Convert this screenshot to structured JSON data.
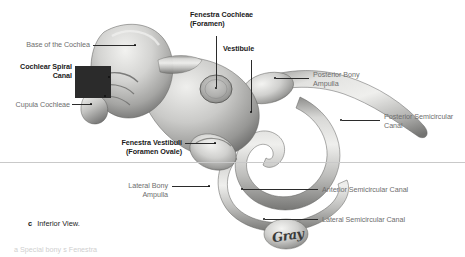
{
  "figure": {
    "caption_letter": "c",
    "caption_text": "Inferior View.",
    "signature": "Gray",
    "cropped_bottom_text": "a  Special  bony  s   Fenestra"
  },
  "labels": [
    {
      "id": "base-of-the-cochlea",
      "text": "Base of the Cochlea",
      "style": "regular",
      "align": "right"
    },
    {
      "id": "cochlear-spiral-canal",
      "text": "Cochlear Spiral\nCanal",
      "style": "bold",
      "align": "right"
    },
    {
      "id": "cupula-cochleae",
      "text": "Cupula Cochleae",
      "style": "regular",
      "align": "right"
    },
    {
      "id": "fenestra-cochleae",
      "text": "Fenestra Cochleae\n(Foramen)",
      "style": "bold",
      "align": "left"
    },
    {
      "id": "vestibule",
      "text": "Vestibule",
      "style": "bold",
      "align": "left"
    },
    {
      "id": "posterior-bony-ampulla",
      "text": "Posterior Bony\nAmpulla",
      "style": "regular",
      "align": "left"
    },
    {
      "id": "posterior-semicircular-canal",
      "text": "Posterior Semicircular\nCanal",
      "style": "regular",
      "align": "left"
    },
    {
      "id": "fenestra-vestibuli",
      "text": "Fenestra Vestibuli\n(Foramen Ovale)",
      "style": "bold",
      "align": "right"
    },
    {
      "id": "lateral-bony-ampulla",
      "text": "Lateral Bony\nAmpulla",
      "style": "regular",
      "align": "right"
    },
    {
      "id": "anterior-semicircular-canal",
      "text": "Anterior Semicircular Canal",
      "style": "regular",
      "align": "left"
    },
    {
      "id": "lateral-semicircular-canal",
      "text": "Lateral Semicircular Canal",
      "style": "regular",
      "align": "left"
    }
  ],
  "colors": {
    "background": "#ffffff",
    "label_gray": "#6e6e6e",
    "label_bold": "#1a1a1a",
    "leader_line": "#2b2b2b",
    "rule": "#c9c9c9",
    "specimen_light": "#e8e8e6",
    "specimen_mid": "#b4b4b2",
    "specimen_dark": "#6f6f6e"
  }
}
